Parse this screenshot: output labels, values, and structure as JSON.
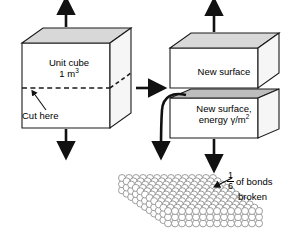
{
  "figure": {
    "background_color": "#ffffff",
    "line_color": "#1a1a1a",
    "face_fill": "#ffffff",
    "top_face_fill": "#d8d8d8",
    "side_face_fill": "#f2f2f2",
    "lattice_color": "#8c8c8c"
  },
  "left_cube": {
    "label_line1": "Unit cube",
    "label_line2_text": "1 m",
    "label_line2_sup": "3",
    "cut_label": "Cut here",
    "cut_line_style": "dashed"
  },
  "right_blocks": {
    "top_block_label": "New surface",
    "bottom_block_label_line1": "New surface,",
    "bottom_block_label_line2_text": "energy γ/m",
    "bottom_block_label_line2_sup": "2"
  },
  "lattice": {
    "annotation_numerator": "1",
    "annotation_denominator": "6",
    "annotation_line1": "of bonds",
    "annotation_line2": "broken",
    "columns": 14,
    "rows": 11,
    "layers": 3
  },
  "arrows": {
    "transition_arrow": "right-arrow",
    "tension_up_left": "up-arrow",
    "tension_down_left": "down-arrow",
    "tension_up_right": "up-arrow",
    "tension_down_right": "down-arrow",
    "curved_arrow": "curved-down-left-arrow",
    "cut_pointer": "cut-pointer-arrow",
    "bonds_pointer": "bonds-pointer-arrow"
  }
}
